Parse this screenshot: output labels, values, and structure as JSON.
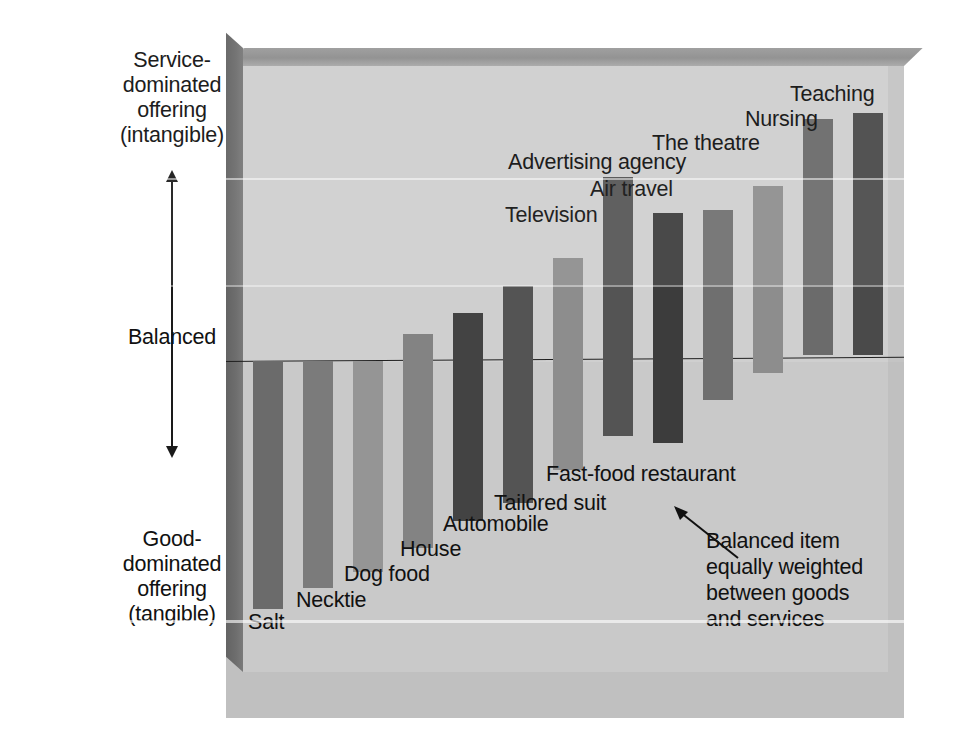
{
  "chart_data": {
    "type": "bar",
    "title": "",
    "subtitle": "",
    "xlabel": "",
    "ylabel": "Goods-services continuum",
    "grid": false,
    "legend": null,
    "axis_scale": {
      "top_label": "Service-\ndominated\noffering\n(intangible)",
      "middle_label": "Balanced",
      "bottom_label": "Good-\ndominated\noffering\n(tangible)",
      "baseline_name": "Balanced",
      "ylim": [
        -1.0,
        1.0
      ]
    },
    "categories": [
      "Salt",
      "Necktie",
      "Dog food",
      "House",
      "Automobile",
      "Tailored suit",
      "Fast-food restaurant",
      "Television",
      "Air travel",
      "Advertising agency",
      "The theatre",
      "Nursing",
      "Teaching"
    ],
    "values": [
      -0.82,
      -0.75,
      -0.7,
      -0.62,
      0.16,
      0.25,
      0.34,
      0.61,
      0.49,
      0.5,
      0.58,
      0.8,
      0.82
    ],
    "bar_tops_relative": [
      0.0,
      0.0,
      0.0,
      0.09,
      0.16,
      0.25,
      0.34,
      0.61,
      0.49,
      0.5,
      0.58,
      0.8,
      0.82
    ],
    "bar_bottoms_relative": [
      -0.82,
      -0.75,
      -0.7,
      -0.62,
      -0.53,
      -0.47,
      -0.36,
      -0.25,
      -0.27,
      -0.13,
      -0.04,
      0.02,
      0.02
    ]
  },
  "axis": {
    "top_label": "Service-\ndominated\noffering\n(intangible)",
    "middle_label": "Balanced",
    "bottom_label": "Good-\ndominated\noffering\n(tangible)"
  },
  "bars": [
    {
      "name": "Salt",
      "label": "Salt",
      "color": "#6b6b6b"
    },
    {
      "name": "Necktie",
      "label": "Necktie",
      "color": "#7b7b7b"
    },
    {
      "name": "Dog food",
      "label": "Dog food",
      "color": "#959595"
    },
    {
      "name": "House",
      "label": "House",
      "color": "#838383"
    },
    {
      "name": "Automobile",
      "label": "Automobile",
      "color": "#434343"
    },
    {
      "name": "Tailored suit",
      "label": "Tailored suit",
      "color": "#545454"
    },
    {
      "name": "Fast-food restaurant",
      "label": "Fast-food restaurant",
      "color": "#8d8d8d"
    },
    {
      "name": "Television",
      "label": "Television",
      "color": "#545454"
    },
    {
      "name": "Air travel",
      "label": "Air travel",
      "color": "#3c3c3c"
    },
    {
      "name": "Advertising agency",
      "label": "Advertising agency",
      "color": "#6f6f6f"
    },
    {
      "name": "The theatre",
      "label": "The theatre",
      "color": "#8d8d8d"
    },
    {
      "name": "Nursing",
      "label": "Nursing",
      "color": "#6b6b6b"
    },
    {
      "name": "Teaching",
      "label": "Teaching",
      "color": "#4a4a4a"
    }
  ],
  "annotation": {
    "text": "Balanced item\nequally weighted\nbetween goods\nand services"
  },
  "colors": {
    "background": "#ffffff",
    "panel": "#d2d2d2",
    "floor": "#c4c4c4",
    "frame_dark": "#6e6e6e",
    "text": "#111111",
    "baseline": "#202020"
  }
}
